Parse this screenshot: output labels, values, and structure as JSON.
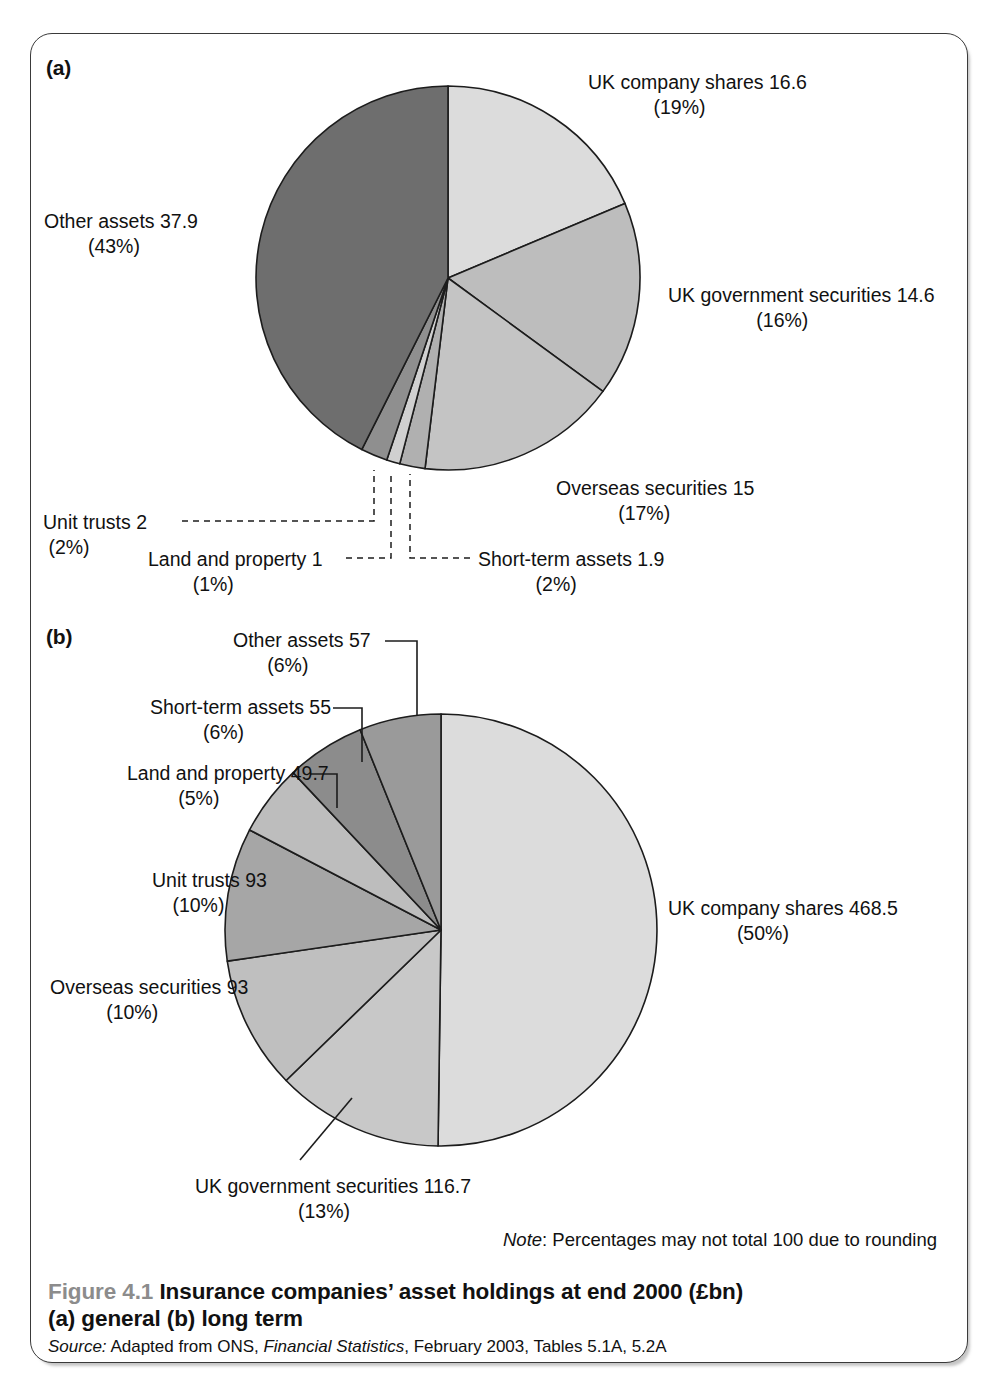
{
  "figure": {
    "panel_a_letter": "(a)",
    "panel_b_letter": "(b)",
    "note_prefix": "Note",
    "note_text": ": Percentages may not total 100 due to rounding",
    "caption_figure_number": "Figure 4.1",
    "caption_title": "Insurance companies’ asset holdings at end 2000 (£bn)",
    "caption_line2": "(a) general  (b) long term",
    "source_prefix": "Source:",
    "source_text_1": " Adapted from ONS, ",
    "source_italic": "Financial Statistics",
    "source_text_2": ", February 2003, Tables 5.1A, 5.2A"
  },
  "colors": {
    "page_background": "#ffffff",
    "frame_border": "#3a3a3a",
    "slice_outline": "#1c1c1c",
    "text": "#111111",
    "figure_number": "#8c8c8c",
    "shade_lightest": "#dcdcdc",
    "shade_light": "#c8c8c8",
    "shade_mid_light": "#bdbdbd",
    "shade_mid": "#aaaaaa",
    "shade_mid_dark": "#9a9a9a",
    "shade_dark": "#8a8a8a",
    "shade_darkest": "#6e6e6e"
  },
  "chart_data": [
    {
      "type": "pie",
      "id": "pie-a",
      "title": "(a) general",
      "unit": "£bn",
      "center": {
        "x": 448,
        "y": 278
      },
      "radius": 192,
      "start_angle_deg": -90,
      "direction": "clockwise",
      "categories": [
        "UK company shares",
        "UK government securities",
        "Overseas securities",
        "Short-term assets",
        "Land and property",
        "Unit trusts",
        "Other assets"
      ],
      "values": [
        16.6,
        14.6,
        15,
        1.9,
        1,
        2,
        37.9
      ],
      "percents": [
        19,
        16,
        17,
        2,
        1,
        2,
        43
      ],
      "value_labels": [
        "16.6",
        "14.6",
        "15",
        "1.9",
        "1",
        "2",
        "37.9"
      ],
      "percent_labels": [
        "(19%)",
        "(16%)",
        "(17%)",
        "(2%)",
        "(1%)",
        "(2%)",
        "(43%)"
      ],
      "slice_fills": [
        "#dcdcdc",
        "#bdbdbd",
        "#c4c4c4",
        "#b0b0b0",
        "#d0d0d0",
        "#8f8f8f",
        "#6e6e6e"
      ],
      "legend_position": "callout-labels",
      "labels": [
        {
          "key": "ukshares",
          "line1": "UK company shares 16.6",
          "line2": "(19%)"
        },
        {
          "key": "ukgov",
          "line1": "UK government securities 14.6",
          "line2": "(16%)"
        },
        {
          "key": "overseas",
          "line1": "Overseas securities 15",
          "line2": "(17%)"
        },
        {
          "key": "short",
          "line1": "Short-term assets 1.9",
          "line2": "(2%)"
        },
        {
          "key": "land",
          "line1": "Land and property 1",
          "line2": "(1%)"
        },
        {
          "key": "unit",
          "line1": "Unit trusts 2",
          "line2": "(2%)"
        },
        {
          "key": "other",
          "line1": "Other assets 37.9",
          "line2": "(43%)"
        }
      ]
    },
    {
      "type": "pie",
      "id": "pie-b",
      "title": "(b) long term",
      "unit": "£bn",
      "center": {
        "x": 441,
        "y": 930
      },
      "radius": 216,
      "start_angle_deg": -90,
      "direction": "clockwise",
      "categories": [
        "UK company shares",
        "UK government securities",
        "Overseas securities",
        "Unit trusts",
        "Land and property",
        "Short-term assets",
        "Other assets"
      ],
      "values": [
        468.5,
        116.7,
        93,
        93,
        49.7,
        55,
        57
      ],
      "percents": [
        50,
        13,
        10,
        10,
        5,
        6,
        6
      ],
      "value_labels": [
        "468.5",
        "116.7",
        "93",
        "93",
        "49.7",
        "55",
        "57"
      ],
      "percent_labels": [
        "(50%)",
        "(13%)",
        "(10%)",
        "(10%)",
        "(5%)",
        "(6%)",
        "(6%)"
      ],
      "slice_fills": [
        "#dcdcdc",
        "#c8c8c8",
        "#bfbfbf",
        "#a6a6a6",
        "#bdbdbd",
        "#8c8c8c",
        "#9a9a9a"
      ],
      "legend_position": "callout-labels",
      "labels": [
        {
          "key": "ukshares",
          "line1": "UK company shares 468.5",
          "line2": "(50%)"
        },
        {
          "key": "ukgov",
          "line1": "UK government securities 116.7",
          "line2": "(13%)"
        },
        {
          "key": "overseas",
          "line1": "Overseas securities 93",
          "line2": "(10%)"
        },
        {
          "key": "unit",
          "line1": "Unit trusts 93",
          "line2": "(10%)"
        },
        {
          "key": "land",
          "line1": "Land and property 49.7",
          "line2": "(5%)"
        },
        {
          "key": "short",
          "line1": "Short-term assets 55",
          "line2": "(6%)"
        },
        {
          "key": "other",
          "line1": "Other assets 57",
          "line2": "(6%)"
        }
      ]
    }
  ]
}
